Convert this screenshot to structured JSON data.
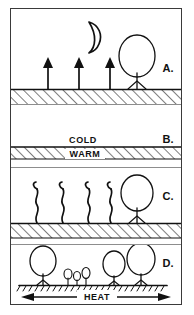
{
  "figure": {
    "background_color": "#ffffff",
    "ink_color": "#111111",
    "frame_color": "#3a3a3a",
    "panel_count": 4
  },
  "panels": [
    {
      "id": "panel-a",
      "label": "A.",
      "sky_icon": "crescent-moon-icon",
      "ground": "hatched-ground",
      "arrows": {
        "kind": "straight-up-arrow",
        "count": 3,
        "direction": "up"
      },
      "vegetation": [
        {
          "kind": "tree",
          "size": "large"
        }
      ],
      "text_labels": []
    },
    {
      "id": "panel-b",
      "label": "B.",
      "sky_icon": "",
      "ground": "hatched-band",
      "arrows": {
        "kind": "none",
        "count": 0,
        "direction": ""
      },
      "vegetation": [],
      "text_labels": [
        {
          "name": "cold-label",
          "text": "COLD",
          "position": "above-line"
        },
        {
          "name": "warm-label",
          "text": "WARM",
          "position": "in-band"
        }
      ]
    },
    {
      "id": "panel-c",
      "label": "C.",
      "sky_icon": "",
      "ground": "hatched-ground",
      "arrows": {
        "kind": "wavy-up-arrow",
        "count": 4,
        "direction": "up"
      },
      "vegetation": [
        {
          "kind": "tree",
          "size": "large"
        }
      ],
      "text_labels": []
    },
    {
      "id": "panel-d",
      "label": "D.",
      "sky_icon": "",
      "ground": "hatched-line",
      "arrows": {
        "kind": "horizontal-double-arrow",
        "count": 1,
        "direction": "left-right"
      },
      "vegetation": [
        {
          "kind": "tree",
          "size": "large"
        },
        {
          "kind": "shrub",
          "size": "small"
        },
        {
          "kind": "shrub",
          "size": "small"
        },
        {
          "kind": "shrub",
          "size": "small"
        },
        {
          "kind": "tree",
          "size": "medium"
        },
        {
          "kind": "tree",
          "size": "large"
        }
      ],
      "text_labels": [
        {
          "name": "heat-label",
          "text": "HEAT",
          "position": "on-arrow"
        }
      ]
    }
  ]
}
